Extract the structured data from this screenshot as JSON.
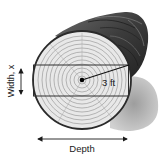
{
  "diagram": {
    "labels": {
      "radius": "3 ft",
      "width": "Width, x",
      "depth": "Depth"
    },
    "colors": {
      "log_bark": "#3a3a3a",
      "log_face": "#e6e6e6",
      "rings": "#8a8a8a",
      "beam_outline": "#333333",
      "shadow": "#9a9a9a",
      "text": "#1a1a1a"
    }
  }
}
